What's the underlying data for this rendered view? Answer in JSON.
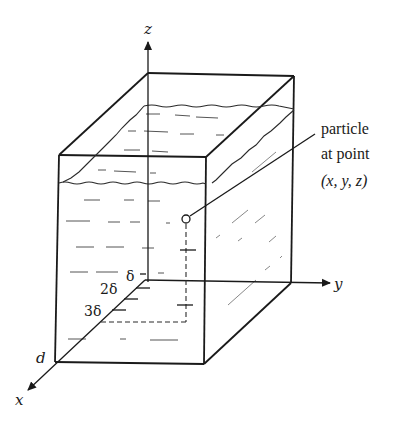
{
  "figure": {
    "type": "3d-box-diagram",
    "axes": {
      "x": "x",
      "y": "y",
      "z": "z"
    },
    "depth_label": "d",
    "ticks": [
      "δ",
      "2δ",
      "3δ"
    ],
    "annotation": {
      "line1": "particle",
      "line2": "at point",
      "line3": "(x, y, z)"
    },
    "colors": {
      "ink": "#1a1a1a",
      "background": "#ffffff"
    }
  }
}
